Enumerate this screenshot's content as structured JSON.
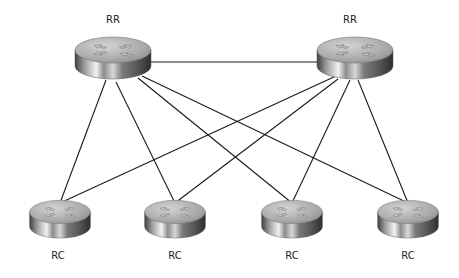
{
  "diagram": {
    "type": "network-topology",
    "nodes": [
      {
        "id": "rr1",
        "label": "RR",
        "role": "route-reflector",
        "icon": "router-icon",
        "cx": 113,
        "cy": 56
      },
      {
        "id": "rr2",
        "label": "RR",
        "role": "route-reflector",
        "icon": "router-icon",
        "cx": 355,
        "cy": 56
      },
      {
        "id": "rc1",
        "label": "RC",
        "role": "route-reflector-client",
        "icon": "router-icon",
        "cx": 60,
        "cy": 218
      },
      {
        "id": "rc2",
        "label": "RC",
        "role": "route-reflector-client",
        "icon": "router-icon",
        "cx": 175,
        "cy": 218
      },
      {
        "id": "rc3",
        "label": "RC",
        "role": "route-reflector-client",
        "icon": "router-icon",
        "cx": 292,
        "cy": 218
      },
      {
        "id": "rc4",
        "label": "RC",
        "role": "route-reflector-client",
        "icon": "router-icon",
        "cx": 408,
        "cy": 218
      }
    ],
    "edges": [
      {
        "from": "rr1",
        "to": "rr2"
      },
      {
        "from": "rr1",
        "to": "rc1"
      },
      {
        "from": "rr1",
        "to": "rc2"
      },
      {
        "from": "rr1",
        "to": "rc3"
      },
      {
        "from": "rr1",
        "to": "rc4"
      },
      {
        "from": "rr2",
        "to": "rc1"
      },
      {
        "from": "rr2",
        "to": "rc2"
      },
      {
        "from": "rr2",
        "to": "rc3"
      },
      {
        "from": "rr2",
        "to": "rc4"
      }
    ]
  },
  "colors": {
    "background": "#ffffff",
    "line": "#1a1a1a",
    "router_top": "#b5b5b5",
    "router_side_light": "#e8e8e8",
    "router_side_dark": "#4a4a4a",
    "label": "#222222"
  }
}
